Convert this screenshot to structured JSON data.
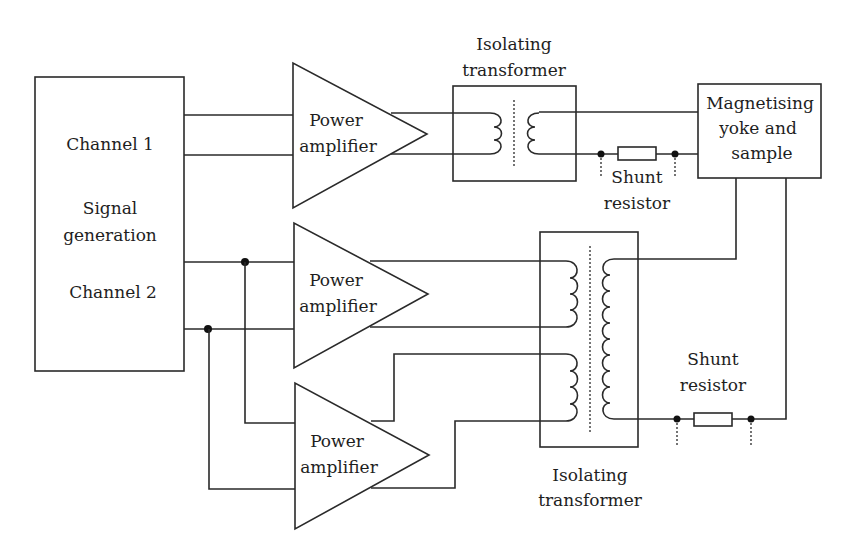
{
  "diagram": {
    "type": "block-schematic",
    "signal_generator": {
      "channel1": "Channel 1",
      "title_line1": "Signal",
      "title_line2": "generation",
      "channel2": "Channel 2"
    },
    "amplifier_top": {
      "line1": "Power",
      "line2": "amplifier"
    },
    "amplifier_middle": {
      "line1": "Power",
      "line2": "amplifier"
    },
    "amplifier_bottom": {
      "line1": "Power",
      "line2": "amplifier"
    },
    "transformer_top": {
      "line1": "Isolating",
      "line2": "transformer"
    },
    "transformer_bottom": {
      "line1": "Isolating",
      "line2": "transformer"
    },
    "shunt_top": {
      "line1": "Shunt",
      "line2": "resistor"
    },
    "shunt_bottom": {
      "line1": "Shunt",
      "line2": "resistor"
    },
    "yoke": {
      "line1": "Magnetising",
      "line2": "yoke and",
      "line3": "sample"
    }
  },
  "colors": {
    "line": "#2a2a2a",
    "text": "#1e1e1e",
    "background": "#ffffff"
  }
}
